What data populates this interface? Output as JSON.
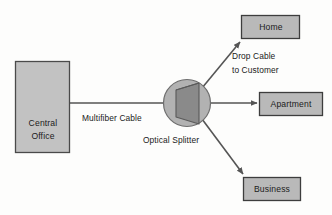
{
  "diagram": {
    "type": "network-topology",
    "background_color": "#fdfdfc",
    "nodes": [
      {
        "id": "central-office",
        "label_line1": "Central",
        "label_line2": "Office",
        "shape": "rectangle",
        "fill": "#c2c2c2",
        "stroke": "#4a4a4a",
        "x": 15,
        "y": 61,
        "w": 55,
        "h": 92
      },
      {
        "id": "home",
        "label": "Home",
        "shape": "rectangle",
        "fill": "#b9b9b9",
        "stroke": "#3d3d3d",
        "x": 241,
        "y": 15,
        "w": 59,
        "h": 24
      },
      {
        "id": "apartment",
        "label": "Apartment",
        "shape": "rectangle",
        "fill": "#b9b9b9",
        "stroke": "#3d3d3d",
        "x": 259,
        "y": 92,
        "w": 64,
        "h": 24
      },
      {
        "id": "business",
        "label": "Business",
        "shape": "rectangle",
        "fill": "#b9b9b9",
        "stroke": "#3d3d3d",
        "x": 243,
        "y": 177,
        "w": 58,
        "h": 24
      },
      {
        "id": "optical-splitter",
        "label": "Optical Splitter",
        "shape": "circle",
        "fill": "#b2b2b2",
        "stroke": "#6e6e6e",
        "cx": 187,
        "cy": 103,
        "r": 24,
        "inner_shape": "prism",
        "inner_fill": "#8a8a8a",
        "inner_stroke": "#5a5a5a"
      }
    ],
    "edges": [
      {
        "id": "multifiber-cable",
        "label": "Multifiber Cable",
        "from": "central-office",
        "to": "optical-splitter",
        "arrow": false,
        "stroke": "#555555"
      },
      {
        "id": "drop-cable-home",
        "label_line1": "Drop Cable",
        "label_line2": "to Customer",
        "from": "optical-splitter",
        "to": "home",
        "arrow": true,
        "stroke": "#555555"
      },
      {
        "id": "drop-cable-apartment",
        "from": "optical-splitter",
        "to": "apartment",
        "arrow": true,
        "stroke": "#555555"
      },
      {
        "id": "drop-cable-business",
        "from": "optical-splitter",
        "to": "business",
        "arrow": true,
        "stroke": "#555555"
      }
    ],
    "labels": {
      "multifiber_cable": "Multifiber Cable",
      "optical_splitter": "Optical Splitter",
      "drop_cable_line1": "Drop Cable",
      "drop_cable_line2": "to Customer",
      "central_office_line1": "Central",
      "central_office_line2": "Office",
      "home": "Home",
      "apartment": "Apartment",
      "business": "Business"
    }
  }
}
